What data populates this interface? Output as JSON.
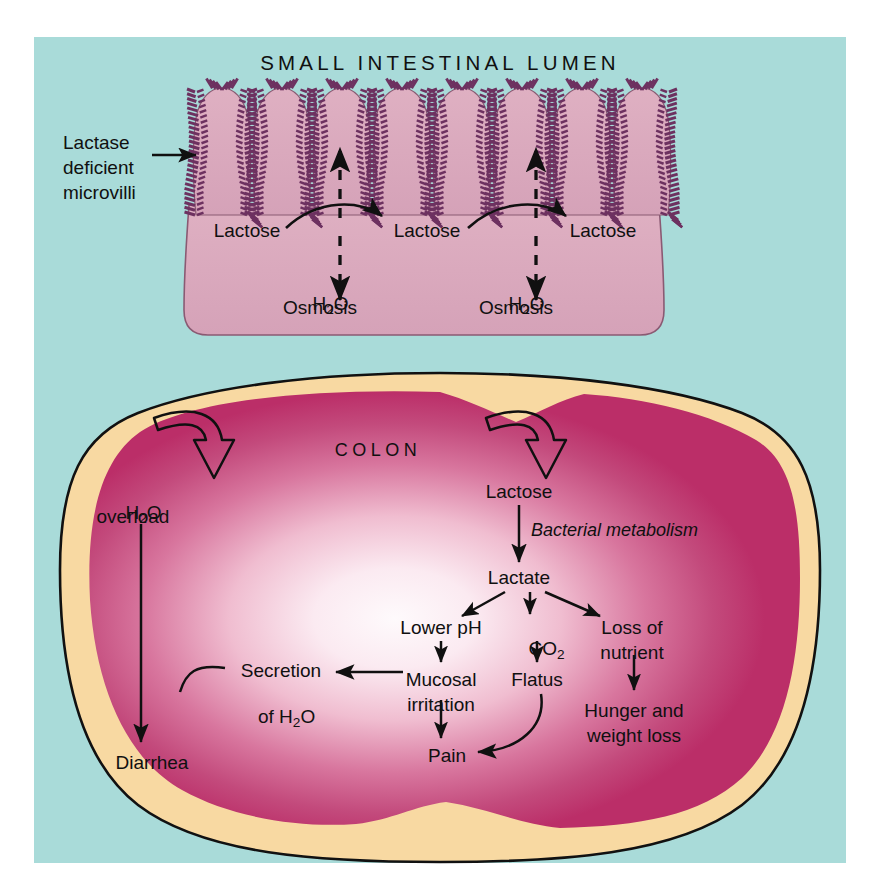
{
  "figure": {
    "background_color": "#ffffff",
    "panel_color": "#a9dbd9",
    "title": "SMALL INTESTINAL LUMEN"
  },
  "palette": {
    "lumen_background": "#a9dbd9",
    "small_intestine_mucosa": "#d9a8bd",
    "microvilli_stroke": "#6d3160",
    "colon_serosa": "#f8d9a2",
    "colon_mucosa": "#bf386e",
    "colon_mucosa_center": "#fdf2f6",
    "outline": "#111111",
    "text": "#101010"
  },
  "small_intestine": {
    "title": "SMALL INTESTINAL LUMEN",
    "villi_count": 8,
    "annotation": {
      "name": "lactase-deficient-microvilli",
      "lines": [
        "Lactase",
        "deficient",
        "microvilli"
      ]
    },
    "lactose_labels": [
      {
        "text": "Lactose",
        "x": 247,
        "y": 232
      },
      {
        "text": "Lactose",
        "x": 427,
        "y": 232
      },
      {
        "text": "Lactose",
        "x": 603,
        "y": 232
      }
    ],
    "osmosis_groups": [
      {
        "molecule": "H",
        "subscript": "2",
        "molecule_tail": "O",
        "caption": "Osmosis",
        "x": 320,
        "y": 285
      },
      {
        "molecule": "H",
        "subscript": "2",
        "molecule_tail": "O",
        "caption": "Osmosis",
        "x": 516,
        "y": 285
      }
    ]
  },
  "colon": {
    "title": "COLON",
    "nodes": [
      {
        "id": "h2o-overload",
        "label_line1": "H2O",
        "label_line2": "overload",
        "x": 133,
        "y": 492
      },
      {
        "id": "diarrhea",
        "label_line1": "Diarrhea",
        "label_line2": "",
        "x": 152,
        "y": 762
      },
      {
        "id": "secretion-h2o",
        "label_line1": "Secretion",
        "label_line2": "of H2O",
        "x": 281,
        "y": 680
      },
      {
        "id": "lactose-colon",
        "label_line1": "Lactose",
        "label_line2": "",
        "x": 519,
        "y": 492
      },
      {
        "id": "bacterial-met",
        "label_line1": "Bacterial metabolism",
        "label_line2": "",
        "x": 613,
        "y": 531
      },
      {
        "id": "lactate",
        "label_line1": "Lactate",
        "label_line2": "",
        "x": 519,
        "y": 578
      },
      {
        "id": "lower-ph",
        "label_line1": "Lower pH",
        "label_line2": "",
        "x": 441,
        "y": 628
      },
      {
        "id": "co2",
        "label_line1": "CO2",
        "label_line2": "",
        "x": 536,
        "y": 628
      },
      {
        "id": "loss-of-nutrient",
        "label_line1": "Loss of",
        "label_line2": "nutrient",
        "x": 632,
        "y": 628
      },
      {
        "id": "mucosal-irritation",
        "label_line1": "Mucosal",
        "label_line2": "irritation",
        "x": 441,
        "y": 680
      },
      {
        "id": "flatus",
        "label_line1": "Flatus",
        "label_line2": "",
        "x": 537,
        "y": 680
      },
      {
        "id": "hunger-weight",
        "label_line1": "Hunger and",
        "label_line2": "weight loss",
        "x": 634,
        "y": 711
      },
      {
        "id": "pain",
        "label_line1": "Pain",
        "label_line2": "",
        "x": 447,
        "y": 755
      }
    ],
    "edges": [
      {
        "from": "inflow-left",
        "to": "h2o-overload",
        "style": "hollow-curved"
      },
      {
        "from": "inflow-right",
        "to": "lactose-colon",
        "style": "hollow-curved"
      },
      {
        "from": "h2o-overload",
        "to": "diarrhea",
        "style": "solid"
      },
      {
        "from": "lactose-colon",
        "to": "lactate",
        "style": "solid"
      },
      {
        "from": "lactate",
        "to": "lower-ph",
        "style": "solid"
      },
      {
        "from": "lactate",
        "to": "co2",
        "style": "solid"
      },
      {
        "from": "lactate",
        "to": "loss-of-nutrient",
        "style": "solid"
      },
      {
        "from": "lower-ph",
        "to": "mucosal-irritation",
        "style": "solid"
      },
      {
        "from": "co2",
        "to": "flatus",
        "style": "solid"
      },
      {
        "from": "loss-of-nutrient",
        "to": "hunger-weight",
        "style": "solid"
      },
      {
        "from": "mucosal-irritation",
        "to": "secretion-h2o",
        "style": "solid"
      },
      {
        "from": "mucosal-irritation",
        "to": "pain",
        "style": "solid"
      },
      {
        "from": "flatus",
        "to": "pain",
        "style": "curved"
      },
      {
        "from": "secretion-h2o",
        "to": "diarrhea-line",
        "style": "curved-join"
      }
    ]
  }
}
